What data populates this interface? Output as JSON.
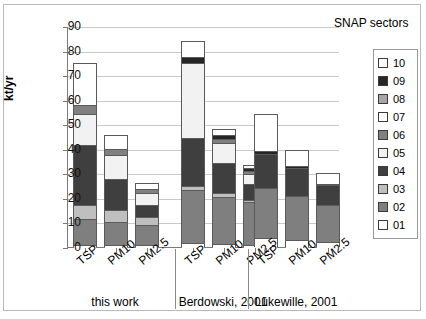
{
  "chart_data": {
    "type": "bar",
    "subtype": "stacked-column",
    "title": "",
    "legend_title": "SNAP sectors",
    "legend_position": "right",
    "xlabel": "",
    "ylabel": "kt/yr",
    "ylim": [
      0,
      90
    ],
    "yticks": [
      0,
      10,
      20,
      30,
      40,
      50,
      60,
      70,
      80,
      90
    ],
    "grid": true,
    "groups": [
      "this work",
      "Berdowski, 2001",
      "Lükewille, 2001"
    ],
    "categories": [
      "TSP",
      "PM10",
      "PM2.5",
      "TSP",
      "PM10",
      "PM2.5",
      "TSP",
      "PM10",
      "PM2.5"
    ],
    "series": [
      {
        "name": "01",
        "color": "#ffffff",
        "values": [
          1.0,
          0.8,
          0.6,
          1.5,
          1.2,
          0.8,
          3.5,
          2.8,
          2.2
        ]
      },
      {
        "name": "02",
        "color": "#7f7f7f",
        "values": [
          10.5,
          9.2,
          8.4,
          21.5,
          19.0,
          17.5,
          20.5,
          18.0,
          15.0
        ]
      },
      {
        "name": "03",
        "color": "#bfbfbf",
        "values": [
          5.5,
          5.0,
          3.0,
          2.0,
          1.8,
          1.0,
          0.0,
          0.0,
          0.0
        ]
      },
      {
        "name": "04",
        "color": "#3f3f3f",
        "values": [
          24.5,
          12.5,
          5.0,
          19.5,
          12.0,
          6.5,
          14.0,
          11.5,
          8.0
        ]
      },
      {
        "name": "05",
        "color": "#f2f2f2",
        "values": [
          12.5,
          10.0,
          5.0,
          30.5,
          8.5,
          4.0,
          0.0,
          0.0,
          0.0
        ]
      },
      {
        "name": "06",
        "color": "#808080",
        "values": [
          4.0,
          2.5,
          1.5,
          0.0,
          1.5,
          1.0,
          0.0,
          0.0,
          0.0
        ]
      },
      {
        "name": "07",
        "color": "#ffffff",
        "values": [
          17.0,
          5.5,
          2.5,
          0.0,
          0.0,
          0.0,
          0.0,
          0.0,
          0.0
        ]
      },
      {
        "name": "08",
        "color": "#a6a6a6",
        "values": [
          0.0,
          0.0,
          0.0,
          0.0,
          0.0,
          0.0,
          0.0,
          0.0,
          0.0
        ]
      },
      {
        "name": "09",
        "color": "#262626",
        "values": [
          0.0,
          0.0,
          0.0,
          2.5,
          1.5,
          1.2,
          1.0,
          0.8,
          0.6
        ]
      },
      {
        "name": "10",
        "color": "#ffffff",
        "values": [
          0.0,
          0.0,
          0.0,
          6.5,
          2.5,
          1.5,
          15.0,
          6.5,
          4.5
        ]
      }
    ],
    "totals": [
      75.0,
      45.5,
      26.0,
      84.0,
      48.0,
      33.5,
      54.0,
      39.6,
      30.3
    ],
    "annotations": []
  },
  "legend": {
    "title": "SNAP sectors",
    "entries": [
      {
        "label": "10",
        "color": "#ffffff"
      },
      {
        "label": "09",
        "color": "#262626"
      },
      {
        "label": "08",
        "color": "#a6a6a6"
      },
      {
        "label": "07",
        "color": "#ffffff"
      },
      {
        "label": "06",
        "color": "#808080"
      },
      {
        "label": "05",
        "color": "#f2f2f2"
      },
      {
        "label": "04",
        "color": "#3f3f3f"
      },
      {
        "label": "03",
        "color": "#bfbfbf"
      },
      {
        "label": "02",
        "color": "#7f7f7f"
      },
      {
        "label": "01",
        "color": "#ffffff"
      }
    ]
  }
}
